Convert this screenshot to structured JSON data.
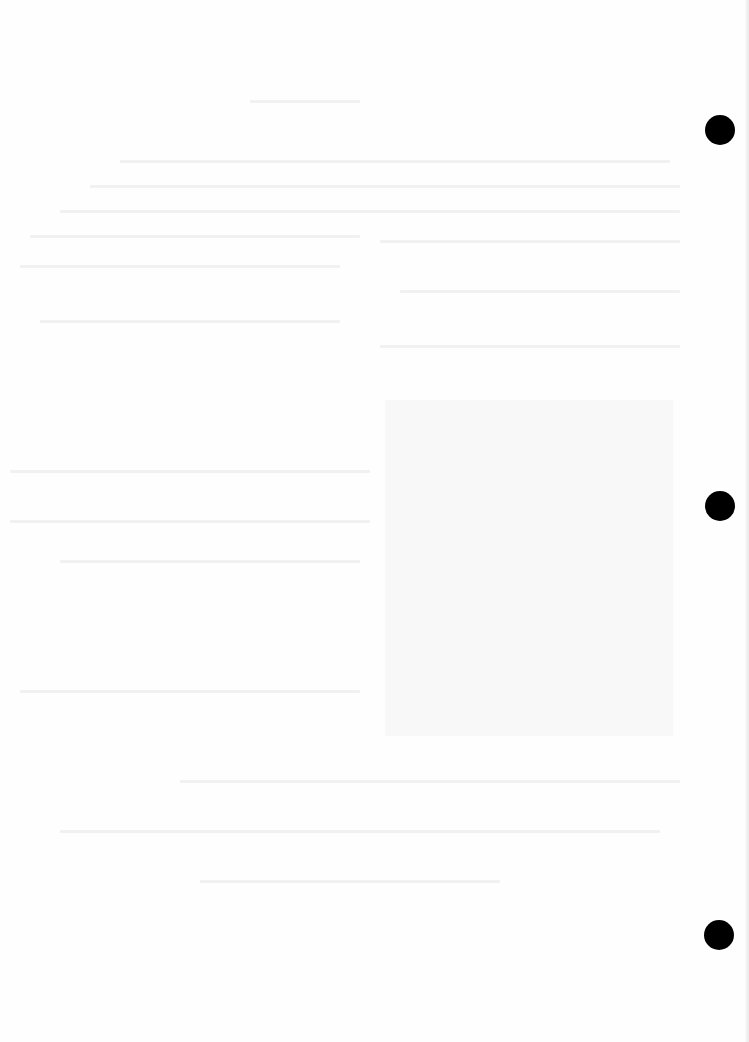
{
  "page": {
    "type": "blank scanned page",
    "background_color": "#fefefe",
    "visible_text": []
  },
  "shaded_region": {
    "color": "#f7f7f7",
    "x": 385,
    "y": 400,
    "width": 288,
    "height": 336
  },
  "punch_holes": [
    {
      "x": 705,
      "y": 115,
      "diameter": 30,
      "color": "#000000"
    },
    {
      "x": 705,
      "y": 491,
      "diameter": 30,
      "color": "#000000"
    },
    {
      "x": 704,
      "y": 920,
      "diameter": 30,
      "color": "#000000"
    }
  ]
}
